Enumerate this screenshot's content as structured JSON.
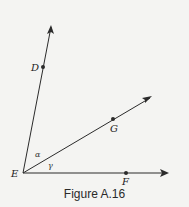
{
  "figure": {
    "caption": "Figure A.16",
    "vertex": {
      "label": "E",
      "x": 23,
      "y": 173
    },
    "rays": [
      {
        "name": "ED",
        "point": {
          "label": "D",
          "x": 43,
          "y": 67
        },
        "tip": {
          "x": 51,
          "y": 26
        }
      },
      {
        "name": "EG",
        "point": {
          "label": "G",
          "x": 113,
          "y": 119
        },
        "tip": {
          "x": 151,
          "y": 97
        }
      },
      {
        "name": "EF",
        "point": {
          "label": "F",
          "x": 126,
          "y": 173
        },
        "tip": {
          "x": 168,
          "y": 173
        }
      }
    ],
    "angles": [
      {
        "label": "α",
        "between": [
          "ED",
          "EG"
        ]
      },
      {
        "label": "γ",
        "between": [
          "EG",
          "EF"
        ]
      }
    ],
    "colors": {
      "line": "#2b2b2b",
      "background": "#f4f4f2"
    }
  }
}
